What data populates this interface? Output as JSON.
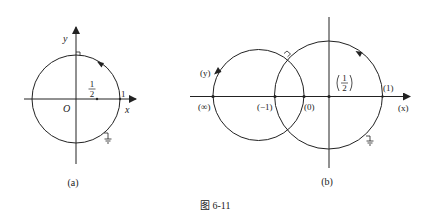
{
  "figure": {
    "caption": "图 6-11",
    "panel_a": {
      "label": "(a)",
      "axis_x_label": "x",
      "axis_y_label": "y",
      "origin_label": "O",
      "point_half_num": "1",
      "point_half_den": "2",
      "point_one_label": "1",
      "ground_symbol": "ground-icon"
    },
    "panel_b": {
      "label": "(b)",
      "axis_x_label": "(x)",
      "axis_y_label": "(y)",
      "point_inf_label": "(∞)",
      "point_neg1_label": "(−1)",
      "point_zero_label": "(0)",
      "point_half_num": "1",
      "point_half_den": "2",
      "point_one_label": "(1)",
      "ground_symbol": "ground-icon"
    }
  },
  "colors": {
    "stroke": "#222222",
    "background": "#ffffff"
  }
}
